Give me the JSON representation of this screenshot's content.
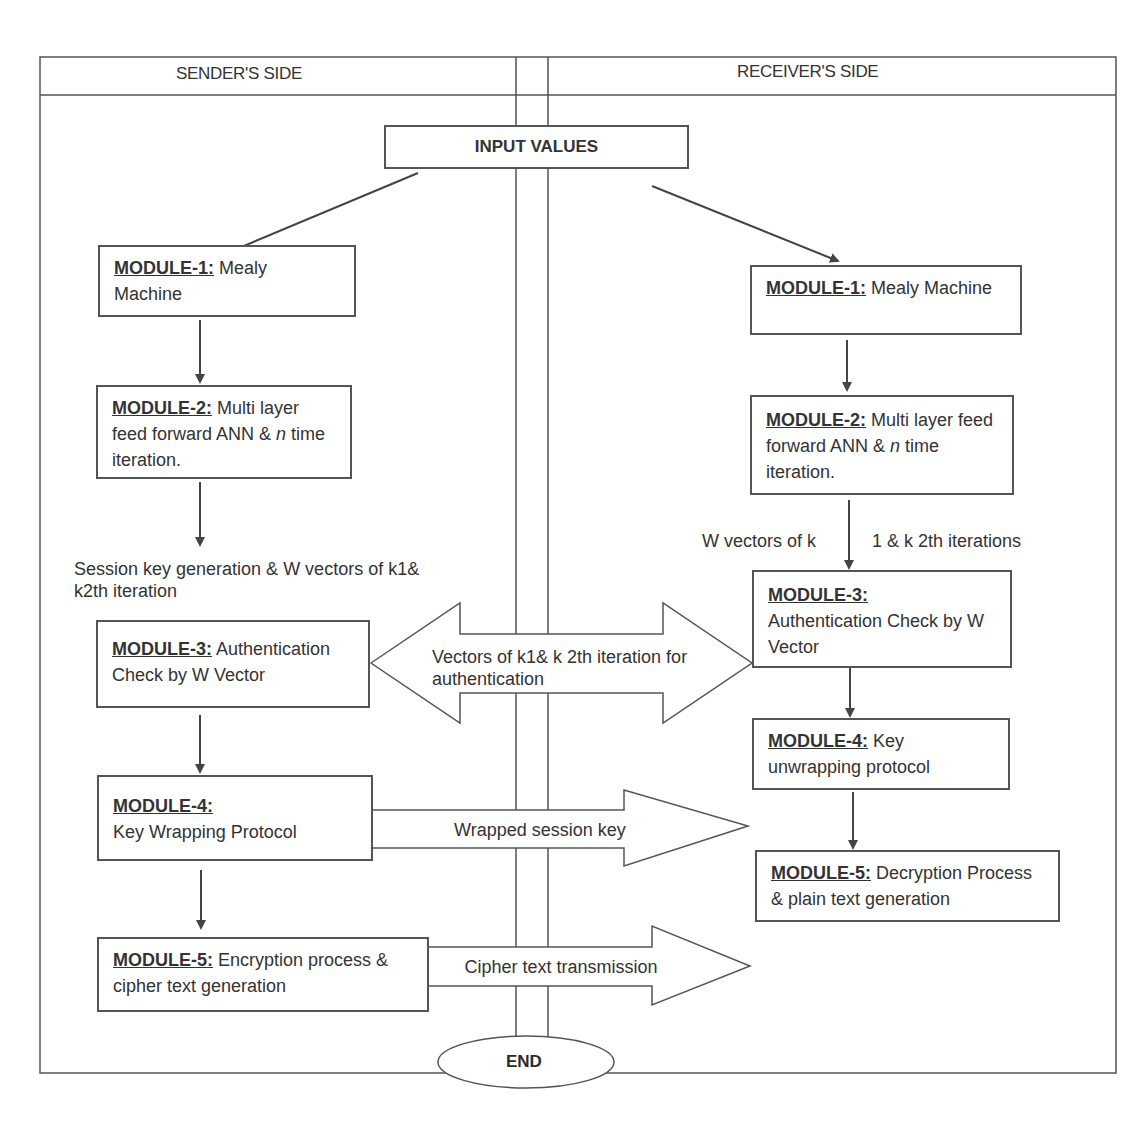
{
  "headers": {
    "sender": "SENDER'S SIDE",
    "receiver": "RECEIVER'S SIDE"
  },
  "start": {
    "label": "INPUT VALUES"
  },
  "end": {
    "label": "END"
  },
  "sender": {
    "modules": [
      {
        "id": "MODULE-1:",
        "text": "Mealy Machine"
      },
      {
        "id": "MODULE-2:",
        "text": "Multi layer feed forward ANN & ",
        "italic": "n",
        "text_after": " time iteration."
      },
      {
        "id": "MODULE-3:",
        "text": "Authentication Check by W Vector"
      },
      {
        "id": "MODULE-4:",
        "text": "Key Wrapping Protocol"
      },
      {
        "id": "MODULE-5:",
        "text": "Encryption process & cipher text generation"
      }
    ],
    "note_after_module2": "Session key generation & W vectors of k1& k2th iteration"
  },
  "receiver": {
    "modules": [
      {
        "id": "MODULE-1:",
        "text": "Mealy Machine"
      },
      {
        "id": "MODULE-2:",
        "text": "Multi layer feed forward ANN & ",
        "italic": "n",
        "text_after": " time iteration."
      },
      {
        "id": "MODULE-3:",
        "text": "Authentication Check by W Vector"
      },
      {
        "id": "MODULE-4:",
        "text": "Key unwrapping protocol"
      },
      {
        "id": "MODULE-5:",
        "text": "Decryption Process & plain text generation"
      }
    ],
    "note_left": "W vectors of k",
    "note_right": "1 & k 2th iterations"
  },
  "flows": {
    "authentication": "Vectors of k1& k 2th iteration for authentication",
    "wrapped_key": "Wrapped session key",
    "cipher": "Cipher text transmission"
  },
  "colors": {
    "line": "#555555",
    "text": "#333333",
    "background": "#ffffff"
  }
}
